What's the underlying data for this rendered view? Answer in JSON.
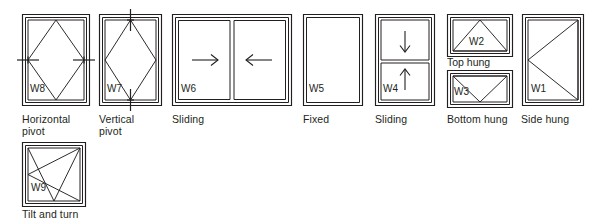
{
  "diagram": {
    "background_color": "#ffffff",
    "line_color": "#231f20",
    "style": "hand-drawn architectural elevation symbols"
  },
  "windows": [
    {
      "id": "W8",
      "code_label": "W8",
      "caption": "Horizontal\npivot",
      "opening_type": "horizontal-pivot",
      "symbol": "diamond with horizontal pivot axis",
      "x": 22,
      "y": 14,
      "w": 68,
      "h": 92
    },
    {
      "id": "W7",
      "code_label": "W7",
      "caption": "Vertical\npivot",
      "opening_type": "vertical-pivot",
      "symbol": "diamond with vertical pivot axis",
      "x": 99,
      "y": 14,
      "w": 63,
      "h": 92
    },
    {
      "id": "W6",
      "code_label": "W6",
      "caption": "Sliding",
      "opening_type": "horizontal-sliding",
      "symbol": "two sashes with inward horizontal arrows",
      "x": 172,
      "y": 14,
      "w": 120,
      "h": 92
    },
    {
      "id": "W5",
      "code_label": "W5",
      "caption": "Fixed",
      "opening_type": "fixed",
      "symbol": "plain frame, no opening indication",
      "x": 303,
      "y": 14,
      "w": 60,
      "h": 92
    },
    {
      "id": "W4",
      "code_label": "W4",
      "caption": "Sliding",
      "opening_type": "vertical-sliding-sash",
      "symbol": "two sashes with down and up arrows",
      "x": 375,
      "y": 14,
      "w": 60,
      "h": 92
    },
    {
      "id": "W2",
      "code_label": "W2",
      "caption": "Top hung",
      "opening_type": "top-hung",
      "symbol": "triangle apex at top centre",
      "x": 447,
      "y": 14,
      "w": 66,
      "h": 43
    },
    {
      "id": "W3",
      "code_label": "W3",
      "caption": "Bottom hung",
      "opening_type": "bottom-hung",
      "symbol": "triangle apex at bottom centre",
      "x": 447,
      "y": 70,
      "w": 66,
      "h": 38
    },
    {
      "id": "W1",
      "code_label": "W1",
      "caption": "Side hung",
      "opening_type": "side-hung",
      "symbol": "triangle apex at left centre",
      "x": 522,
      "y": 14,
      "w": 62,
      "h": 92
    },
    {
      "id": "W9",
      "code_label": "W9",
      "caption": "Tilt and turn",
      "opening_type": "tilt-and-turn",
      "symbol": "side-hung triangle combined with bottom-hung triangle",
      "x": 22,
      "y": 142,
      "w": 64,
      "h": 65
    }
  ],
  "captions": {
    "horizontal_pivot": "Horizontal\npivot",
    "vertical_pivot": "Vertical\npivot",
    "sliding_horizontal": "Sliding",
    "fixed": "Fixed",
    "sliding_vertical": "Sliding",
    "top_hung": "Top hung",
    "bottom_hung": "Bottom hung",
    "side_hung": "Side hung",
    "tilt_and_turn": "Tilt and turn"
  },
  "code_labels": {
    "w1": "W1",
    "w2": "W2",
    "w3": "W3",
    "w4": "W4",
    "w5": "W5",
    "w6": "W6",
    "w7": "W7",
    "w8": "W8",
    "w9": "W9"
  }
}
